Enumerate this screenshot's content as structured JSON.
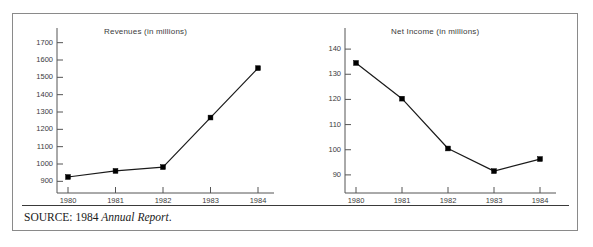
{
  "figure": {
    "source_prefix": "SOURCE: 1984 ",
    "source_italic": "Annual Report",
    "source_suffix": "."
  },
  "colors": {
    "frame": "#8a8a8a",
    "axis": "#555555",
    "line": "#1a1a1a",
    "marker": "#000000",
    "text": "#3b3b3b",
    "divider": "#3a3a3a"
  },
  "chart_data": [
    {
      "type": "line",
      "title": "Revenues (in millions)",
      "xlabel": "",
      "ylabel": "",
      "categories": [
        "1980",
        "1981",
        "1982",
        "1983",
        "1984"
      ],
      "x": [
        1980,
        1981,
        1982,
        1983,
        1984
      ],
      "values": [
        925,
        960,
        982,
        1268,
        1553
      ],
      "ylim": [
        850,
        1750
      ],
      "yticks": [
        900,
        1000,
        1100,
        1200,
        1300,
        1400,
        1500,
        1600,
        1700
      ],
      "ytick_labels": [
        "900",
        "1000",
        "1100",
        "1200",
        "1300",
        "1400",
        "1500",
        "1600",
        "1700"
      ],
      "xtick_labels": [
        "1980",
        "1981",
        "1982",
        "1983",
        "1984"
      ],
      "grid": false,
      "legend": "none",
      "marker": "square"
    },
    {
      "type": "line",
      "title": "Net Income (in millions)",
      "xlabel": "",
      "ylabel": "",
      "categories": [
        "1980",
        "1981",
        "1982",
        "1983",
        "1984"
      ],
      "x": [
        1980,
        1981,
        1982,
        1983,
        1984
      ],
      "values": [
        134.5,
        120.3,
        100.5,
        91.5,
        96.3
      ],
      "ylim": [
        84,
        146
      ],
      "yticks": [
        90,
        100,
        110,
        120,
        130,
        140
      ],
      "ytick_labels": [
        "90",
        "100",
        "110",
        "120",
        "130",
        "140"
      ],
      "xtick_labels": [
        "1980",
        "1981",
        "1982",
        "1983",
        "1984"
      ],
      "grid": false,
      "legend": "none",
      "marker": "square"
    }
  ]
}
